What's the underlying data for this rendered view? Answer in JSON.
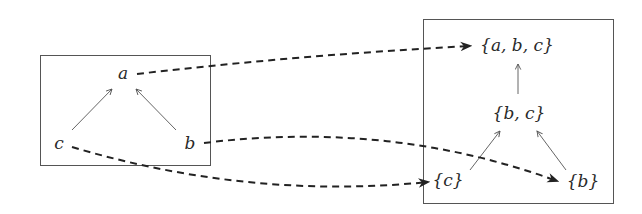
{
  "left_poset": {
    "nodes": [
      {
        "id": "a",
        "label": "a",
        "x": 123,
        "y": 79
      },
      {
        "id": "c",
        "label": "c",
        "x": 59,
        "y": 149
      },
      {
        "id": "b",
        "label": "b",
        "x": 190,
        "y": 149
      }
    ],
    "edges": [
      {
        "from": "c",
        "to": "a"
      },
      {
        "from": "b",
        "to": "a"
      }
    ]
  },
  "right_lattice": {
    "nodes": [
      {
        "id": "abc",
        "label": "{a, b, c}",
        "x": 517,
        "y": 51
      },
      {
        "id": "bc",
        "label": "{b, c}",
        "x": 519,
        "y": 119
      },
      {
        "id": "c_set",
        "label": "{c}",
        "x": 448,
        "y": 186
      },
      {
        "id": "b_set",
        "label": "{b}",
        "x": 583,
        "y": 187
      }
    ],
    "edges": [
      {
        "from": "bc",
        "to": "abc"
      },
      {
        "from": "c_set",
        "to": "bc"
      },
      {
        "from": "b_set",
        "to": "bc"
      }
    ]
  },
  "mappings": [
    {
      "from": "a",
      "to": "{a, b, c}"
    },
    {
      "from": "b",
      "to": "{b}"
    },
    {
      "from": "c",
      "to": "{c}"
    }
  ],
  "colors": {
    "box_stroke": "#555555",
    "edge_stroke": "#555555",
    "dashed_stroke": "#222222",
    "text": "#2a2a2a"
  }
}
